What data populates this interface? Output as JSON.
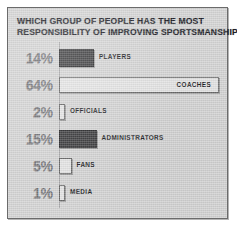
{
  "figure": {
    "title_line1": "WHICH GROUP OF PEOPLE HAS THE MOST",
    "title_line2": "RESPONSIBILITY OF IMPROVING SPORTSMANSHIP?",
    "background_color": "#d4d4d4",
    "frame_color": "#6b6b6b",
    "dark_bar_color": "#3b3b3d",
    "light_bar_color": "#e4e4e4",
    "label_color": "#1d1d24",
    "percent_color": "#6e6e72"
  },
  "chart_data": {
    "type": "bar",
    "orientation": "horizontal",
    "title": "WHICH GROUP OF PEOPLE HAS THE MOST RESPONSIBILITY OF IMPROVING SPORTSMANSHIP?",
    "xlabel": "",
    "ylabel": "",
    "xlim": [
      0,
      64
    ],
    "grid": false,
    "legend": false,
    "unit": "%",
    "categories": [
      "PLAYERS",
      "COACHES",
      "OFFICIALS",
      "ADMINISTRATORS",
      "FANS",
      "MEDIA"
    ],
    "values": [
      14,
      64,
      2,
      15,
      5,
      1
    ],
    "value_labels": [
      "14%",
      "64%",
      "2%",
      "15%",
      "5%",
      "1%"
    ],
    "bar_styles": [
      "dark",
      "light",
      "light",
      "dark",
      "light",
      "light"
    ],
    "label_placement": [
      "outside",
      "inside",
      "outside",
      "outside",
      "outside",
      "outside"
    ],
    "rows": [
      {
        "label": "PLAYERS",
        "value": 14,
        "value_label": "14%",
        "style": "dark",
        "placement": "outside"
      },
      {
        "label": "COACHES",
        "value": 64,
        "value_label": "64%",
        "style": "light",
        "placement": "inside"
      },
      {
        "label": "OFFICIALS",
        "value": 2,
        "value_label": "2%",
        "style": "light",
        "placement": "outside"
      },
      {
        "label": "ADMINISTRATORS",
        "value": 15,
        "value_label": "15%",
        "style": "dark",
        "placement": "outside"
      },
      {
        "label": "FANS",
        "value": 5,
        "value_label": "5%",
        "style": "light",
        "placement": "outside"
      },
      {
        "label": "MEDIA",
        "value": 1,
        "value_label": "1%",
        "style": "light",
        "placement": "outside"
      }
    ]
  }
}
